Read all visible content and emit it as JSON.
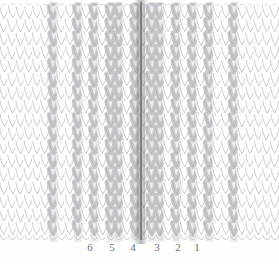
{
  "figure": {
    "kind": "knitted-fabric-structure-illustration",
    "background_color": "#fefefd",
    "width": 279,
    "height": 264
  },
  "fabric": {
    "stitch_type": "stockinette-knit-v-stitch",
    "yarn_color": "#ffffff",
    "yarn_outline_color": "#9a9ca0",
    "shaded_stitch_color": "#c6c8cb",
    "seam_line_color": "#6c6e72",
    "top_edge": "open-live-loops",
    "bottom_edge": "cast-on-edge",
    "columns_total": 34,
    "rows_total": 17,
    "seam_column_index": 17,
    "shaded_column_indices": [
      6,
      9,
      11,
      13,
      14,
      16,
      18,
      19,
      21,
      23,
      25,
      28
    ],
    "seam_x_px": 141
  },
  "wale_labels": {
    "name": "wale-number-labels",
    "color": "#6d6f72",
    "items": [
      {
        "text": "6",
        "x": 90
      },
      {
        "text": "5",
        "x": 112
      },
      {
        "text": "4",
        "x": 133
      },
      {
        "text": "3",
        "x": 157
      },
      {
        "text": "2",
        "x": 178
      },
      {
        "text": "1",
        "x": 197
      }
    ]
  }
}
